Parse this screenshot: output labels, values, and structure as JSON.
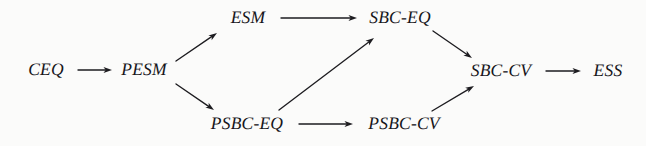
{
  "diagram": {
    "background_color": "#fbfbfa",
    "ink_color": "#1d1c20",
    "nodes": [
      {
        "id": "CEQ",
        "label": "CEQ",
        "x": 46,
        "y": 70,
        "row": "middle"
      },
      {
        "id": "PESM",
        "label": "PESM",
        "x": 144,
        "y": 70,
        "row": "middle"
      },
      {
        "id": "ESM",
        "label": "ESM",
        "x": 248,
        "y": 18,
        "row": "top"
      },
      {
        "id": "SBC-EQ",
        "label": "SBC-EQ",
        "x": 400,
        "y": 18,
        "row": "top"
      },
      {
        "id": "SBC-CV",
        "label": "SBC-CV",
        "x": 501,
        "y": 71,
        "row": "middle"
      },
      {
        "id": "ESS",
        "label": "ESS",
        "x": 608,
        "y": 71,
        "row": "middle"
      },
      {
        "id": "PSBC-EQ",
        "label": "PSBC-EQ",
        "x": 247,
        "y": 124,
        "row": "bottom"
      },
      {
        "id": "PSBC-CV",
        "label": "PSBC-CV",
        "x": 404,
        "y": 124,
        "row": "bottom"
      }
    ],
    "edges": [
      {
        "from": "CEQ",
        "to": "PESM",
        "kind": "horizontal",
        "x1": 78,
        "y1": 70,
        "x2": 112,
        "y2": 70
      },
      {
        "from": "PESM",
        "to": "ESM",
        "kind": "diagonal-up",
        "x1": 176,
        "y1": 61,
        "x2": 217,
        "y2": 33
      },
      {
        "from": "PESM",
        "to": "PSBC-EQ",
        "kind": "diagonal-down",
        "x1": 176,
        "y1": 84,
        "x2": 214,
        "y2": 110
      },
      {
        "from": "ESM",
        "to": "SBC-EQ",
        "kind": "horizontal",
        "x1": 281,
        "y1": 18,
        "x2": 357,
        "y2": 18
      },
      {
        "from": "PSBC-EQ",
        "to": "SBC-EQ",
        "kind": "diagonal-up",
        "x1": 279,
        "y1": 110,
        "x2": 374,
        "y2": 38
      },
      {
        "from": "SBC-EQ",
        "to": "SBC-CV",
        "kind": "diagonal-down",
        "x1": 433,
        "y1": 31,
        "x2": 472,
        "y2": 58
      },
      {
        "from": "PSBC-EQ",
        "to": "PSBC-CV",
        "kind": "horizontal",
        "x1": 299,
        "y1": 124,
        "x2": 353,
        "y2": 124
      },
      {
        "from": "PSBC-CV",
        "to": "SBC-CV",
        "kind": "diagonal-up",
        "x1": 432,
        "y1": 111,
        "x2": 474,
        "y2": 86
      },
      {
        "from": "SBC-CV",
        "to": "ESS",
        "kind": "horizontal",
        "x1": 546,
        "y1": 71,
        "x2": 581,
        "y2": 71
      }
    ]
  }
}
